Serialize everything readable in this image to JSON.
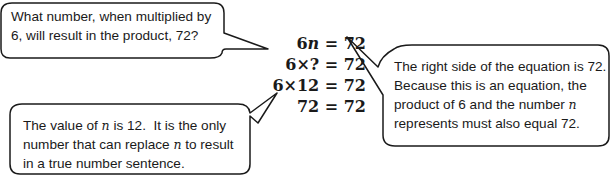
{
  "callouts": {
    "question": {
      "lines": [
        "What number, when multiplied by",
        "6, will result in the product, 72?"
      ]
    },
    "explanation": {
      "line1": "The right side of the equation is 72.",
      "line2": "Because this is an equation, the",
      "line3_pre": "product of 6 and the number ",
      "line3_var": "n",
      "line4": "represents must also equal 72."
    },
    "conclusion": {
      "line1_pre": "The value of ",
      "line1_var": "n",
      "line1_post": " is 12.  It is the only",
      "line2_pre": "number that can replace ",
      "line2_var": "n",
      "line2_post": " to result",
      "line3": "in a true number sentence."
    }
  },
  "equations": [
    {
      "lhs_num": "6",
      "lhs_var": "n",
      "rhs": " = 72"
    },
    {
      "lhs": "6×? = 72"
    },
    {
      "lhs": "6×12 = 72"
    },
    {
      "lhs": "72 = 72"
    }
  ],
  "colors": {
    "stroke": "#1a1a1a",
    "text": "#1a1a1a",
    "background": "#ffffff"
  }
}
